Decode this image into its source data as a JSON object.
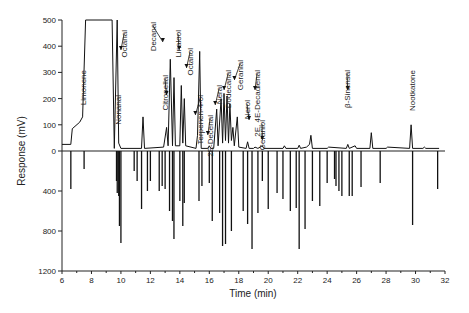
{
  "chart_data": {
    "type": "line",
    "title": "",
    "xlabel": "Time (min)",
    "ylabel": "Response (mV)",
    "xlim": [
      6,
      32
    ],
    "ylim_top": [
      0,
      500
    ],
    "ylim_bottom": [
      0,
      1200
    ],
    "x_ticks": [
      6,
      8,
      10,
      12,
      14,
      16,
      18,
      20,
      22,
      24,
      26,
      28,
      30,
      32
    ],
    "y_ticks_top": [
      0,
      100,
      200,
      300,
      400,
      500
    ],
    "y_ticks_bottom": [
      400,
      800,
      1200
    ],
    "grid": false,
    "legend": null,
    "series": [
      {
        "name": "GC-FID trace (upper, positive)",
        "points": [
          [
            6.0,
            25
          ],
          [
            6.6,
            25
          ],
          [
            6.7,
            85
          ],
          [
            7.2,
            110
          ],
          [
            7.4,
            130
          ],
          [
            7.6,
            500
          ],
          [
            9.4,
            500
          ],
          [
            9.55,
            10
          ],
          [
            9.75,
            500
          ],
          [
            9.85,
            30
          ],
          [
            10.0,
            10
          ],
          [
            11.4,
            10
          ],
          [
            11.5,
            130
          ],
          [
            11.6,
            10
          ],
          [
            12.9,
            15
          ],
          [
            13.1,
            90
          ],
          [
            13.2,
            20
          ],
          [
            13.35,
            350
          ],
          [
            13.5,
            20
          ],
          [
            13.6,
            280
          ],
          [
            13.7,
            20
          ],
          [
            14.0,
            20
          ],
          [
            14.1,
            250
          ],
          [
            14.2,
            30
          ],
          [
            14.3,
            200
          ],
          [
            14.4,
            20
          ],
          [
            15.1,
            10
          ],
          [
            15.2,
            60
          ],
          [
            15.35,
            380
          ],
          [
            15.45,
            10
          ],
          [
            15.9,
            10
          ],
          [
            16.0,
            20
          ],
          [
            16.1,
            10
          ],
          [
            16.3,
            10
          ],
          [
            16.5,
            160
          ],
          [
            16.6,
            20
          ],
          [
            16.8,
            200
          ],
          [
            16.9,
            30
          ],
          [
            17.0,
            220
          ],
          [
            17.1,
            40
          ],
          [
            17.2,
            210
          ],
          [
            17.3,
            30
          ],
          [
            17.4,
            180
          ],
          [
            17.5,
            40
          ],
          [
            17.6,
            90
          ],
          [
            17.7,
            20
          ],
          [
            17.9,
            130
          ],
          [
            18.0,
            15
          ],
          [
            18.5,
            10
          ],
          [
            18.6,
            35
          ],
          [
            18.7,
            10
          ],
          [
            19.0,
            10
          ],
          [
            19.1,
            15
          ],
          [
            19.3,
            10
          ],
          [
            19.6,
            20
          ],
          [
            19.7,
            10
          ],
          [
            21.0,
            10
          ],
          [
            21.1,
            20
          ],
          [
            21.2,
            10
          ],
          [
            22.0,
            10
          ],
          [
            22.1,
            22
          ],
          [
            22.2,
            10
          ],
          [
            22.6,
            15
          ],
          [
            22.8,
            25
          ],
          [
            22.9,
            60
          ],
          [
            23.0,
            10
          ],
          [
            24.0,
            10
          ],
          [
            24.1,
            15
          ],
          [
            25.3,
            10
          ],
          [
            25.4,
            25
          ],
          [
            25.5,
            10
          ],
          [
            25.9,
            20
          ],
          [
            26.0,
            10
          ],
          [
            26.9,
            10
          ],
          [
            27.0,
            70
          ],
          [
            27.1,
            10
          ],
          [
            28.0,
            10
          ],
          [
            28.1,
            15
          ],
          [
            29.6,
            10
          ],
          [
            29.7,
            100
          ],
          [
            29.8,
            10
          ],
          [
            30.5,
            10
          ],
          [
            30.6,
            15
          ],
          [
            30.7,
            10
          ],
          [
            31.6,
            10
          ]
        ]
      },
      {
        "name": "GC-O response (lower, inverted)",
        "sticks": [
          [
            6.6,
            380
          ],
          [
            7.5,
            180
          ],
          [
            9.7,
            300
          ],
          [
            9.75,
            420
          ],
          [
            9.85,
            450
          ],
          [
            9.9,
            750
          ],
          [
            10.0,
            920
          ],
          [
            10.9,
            200
          ],
          [
            11.1,
            300
          ],
          [
            11.4,
            580
          ],
          [
            11.8,
            400
          ],
          [
            12.0,
            300
          ],
          [
            12.6,
            400
          ],
          [
            12.8,
            350
          ],
          [
            13.0,
            380
          ],
          [
            13.3,
            600
          ],
          [
            13.5,
            700
          ],
          [
            13.6,
            880
          ],
          [
            14.0,
            500
          ],
          [
            14.2,
            750
          ],
          [
            14.3,
            520
          ],
          [
            15.3,
            500
          ],
          [
            15.5,
            350
          ],
          [
            16.0,
            320
          ],
          [
            16.2,
            700
          ],
          [
            16.7,
            620
          ],
          [
            16.9,
            950
          ],
          [
            17.1,
            930
          ],
          [
            17.5,
            800
          ],
          [
            18.3,
            600
          ],
          [
            18.6,
            730
          ],
          [
            18.9,
            980
          ],
          [
            19.3,
            620
          ],
          [
            19.6,
            300
          ],
          [
            20.0,
            580
          ],
          [
            20.6,
            420
          ],
          [
            21.0,
            480
          ],
          [
            21.5,
            600
          ],
          [
            21.9,
            570
          ],
          [
            22.1,
            980
          ],
          [
            22.5,
            780
          ],
          [
            23.0,
            500
          ],
          [
            23.5,
            550
          ],
          [
            24.0,
            320
          ],
          [
            24.5,
            280
          ],
          [
            24.6,
            350
          ],
          [
            24.8,
            400
          ],
          [
            25.0,
            450
          ],
          [
            25.5,
            450
          ],
          [
            25.7,
            450
          ],
          [
            26.3,
            360
          ],
          [
            27.6,
            320
          ],
          [
            29.8,
            740
          ],
          [
            31.5,
            380
          ]
        ]
      }
    ],
    "annotations": [
      {
        "label": "Limonene",
        "x": 8.4,
        "arrow": false
      },
      {
        "label": "Octanal",
        "x": 10.0,
        "arrow": true
      },
      {
        "label": "Nonanal",
        "x": 11.5,
        "arrow": false
      },
      {
        "label": "Decanal",
        "x": 12.85,
        "arrow": true
      },
      {
        "label": "Citronellal",
        "x": 13.1,
        "arrow": true
      },
      {
        "label": "Linalool",
        "x": 13.95,
        "arrow": true
      },
      {
        "label": "Octanol",
        "x": 14.45,
        "arrow": true
      },
      {
        "label": "Terpenen-4-ol",
        "x": 15.05,
        "arrow": true
      },
      {
        "label": "2E-Decenal",
        "x": 15.9,
        "arrow": true
      },
      {
        "label": "Neral",
        "x": 16.4,
        "arrow": true
      },
      {
        "label": "Dodecanal",
        "x": 17.0,
        "arrow": true
      },
      {
        "label": "Geranial",
        "x": 17.7,
        "arrow": true
      },
      {
        "label": "Nerol",
        "x": 18.7,
        "arrow": true
      },
      {
        "label": "2E, 4E-Decadienal",
        "x": 19.1,
        "arrow": true
      },
      {
        "label": "Geraniol",
        "x": 19.6,
        "arrow": true
      },
      {
        "label": "β-Sinensal",
        "x": 25.4,
        "arrow": true
      },
      {
        "label": "Nootkatone",
        "x": 29.7,
        "arrow": false
      }
    ]
  }
}
